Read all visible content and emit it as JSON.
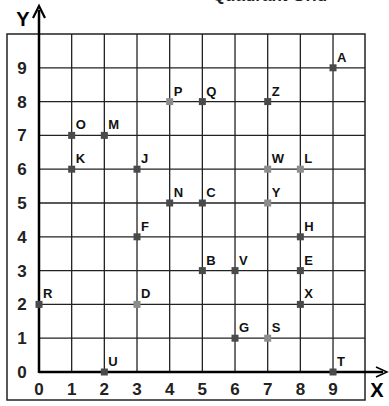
{
  "chart_data": {
    "type": "scatter",
    "title": "Quadrant Grid",
    "xlabel": "X",
    "ylabel": "Y",
    "xlim": [
      0,
      10
    ],
    "ylim": [
      0,
      10
    ],
    "grid": true,
    "x_ticks": [
      "0",
      "1",
      "2",
      "3",
      "4",
      "5",
      "6",
      "7",
      "8",
      "9"
    ],
    "y_ticks": [
      "0",
      "1",
      "2",
      "3",
      "4",
      "5",
      "6",
      "7",
      "8",
      "9"
    ],
    "points": [
      {
        "label": "A",
        "x": 9,
        "y": 9,
        "shade": "dark"
      },
      {
        "label": "P",
        "x": 4,
        "y": 8,
        "shade": "light"
      },
      {
        "label": "Q",
        "x": 5,
        "y": 8,
        "shade": "dark"
      },
      {
        "label": "Z",
        "x": 7,
        "y": 8,
        "shade": "dark"
      },
      {
        "label": "O",
        "x": 1,
        "y": 7,
        "shade": "dark"
      },
      {
        "label": "M",
        "x": 2,
        "y": 7,
        "shade": "dark"
      },
      {
        "label": "K",
        "x": 1,
        "y": 6,
        "shade": "dark"
      },
      {
        "label": "J",
        "x": 3,
        "y": 6,
        "shade": "dark"
      },
      {
        "label": "W",
        "x": 7,
        "y": 6,
        "shade": "light"
      },
      {
        "label": "L",
        "x": 8,
        "y": 6,
        "shade": "light"
      },
      {
        "label": "N",
        "x": 4,
        "y": 5,
        "shade": "dark"
      },
      {
        "label": "C",
        "x": 5,
        "y": 5,
        "shade": "dark"
      },
      {
        "label": "Y",
        "x": 7,
        "y": 5,
        "shade": "light"
      },
      {
        "label": "F",
        "x": 3,
        "y": 4,
        "shade": "dark"
      },
      {
        "label": "H",
        "x": 8,
        "y": 4,
        "shade": "dark"
      },
      {
        "label": "B",
        "x": 5,
        "y": 3,
        "shade": "dark"
      },
      {
        "label": "V",
        "x": 6,
        "y": 3,
        "shade": "dark"
      },
      {
        "label": "E",
        "x": 8,
        "y": 3,
        "shade": "dark"
      },
      {
        "label": "R",
        "x": 0,
        "y": 2,
        "shade": "dark"
      },
      {
        "label": "D",
        "x": 3,
        "y": 2,
        "shade": "light"
      },
      {
        "label": "X",
        "x": 8,
        "y": 2,
        "shade": "dark"
      },
      {
        "label": "G",
        "x": 6,
        "y": 1,
        "shade": "dark"
      },
      {
        "label": "S",
        "x": 7,
        "y": 1,
        "shade": "light"
      },
      {
        "label": "U",
        "x": 2,
        "y": 0,
        "shade": "dark"
      },
      {
        "label": "T",
        "x": 9,
        "y": 0,
        "shade": "dark"
      }
    ],
    "colors": {
      "dark": "#4a4a4a",
      "light": "#8c8c8c",
      "grid": "#222222",
      "axis": "#000000"
    }
  }
}
